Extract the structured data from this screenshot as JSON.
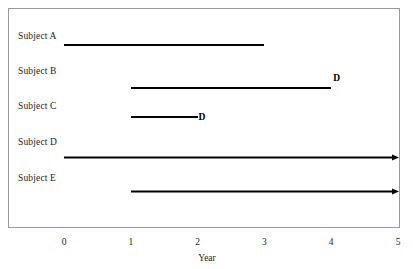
{
  "chart_data": {
    "type": "bar",
    "title": "",
    "subtitle": "",
    "xlabel": "Year",
    "ylabel": "",
    "xlim": [
      -0.5,
      5.2
    ],
    "xticks": [
      0,
      1,
      2,
      3,
      4,
      5
    ],
    "xtick_labels": [
      "0",
      "1",
      "2",
      "3",
      "4",
      "5"
    ],
    "grid": false,
    "legend": null,
    "categories": [
      "Subject A",
      "Subject B",
      "Subject C",
      "Subject D",
      "Subject E"
    ],
    "series": [
      {
        "name": "Follow-up time",
        "values": [
          3,
          3,
          1,
          5,
          4
        ]
      }
    ],
    "bars": [
      {
        "label": "Subject A",
        "start": 0,
        "end": 3,
        "end_type": "plain",
        "event_label": ""
      },
      {
        "label": "Subject B",
        "start": 1,
        "end": 4,
        "end_type": "event",
        "event_label": "D"
      },
      {
        "label": "Subject C",
        "start": 1,
        "end": 2,
        "end_type": "event",
        "event_label": "D"
      },
      {
        "label": "Subject D",
        "start": 0,
        "end": 5,
        "end_type": "arrow",
        "event_label": ""
      },
      {
        "label": "Subject E",
        "start": 1,
        "end": 5,
        "end_type": "arrow",
        "event_label": ""
      }
    ],
    "annotations": [
      "D",
      "D"
    ],
    "colors": {
      "bar": "#000000",
      "frame": "#9a9a9a",
      "text": "#1c1c1c",
      "background": "#ffffff"
    }
  },
  "axis": {
    "x_title": "Year",
    "ticks": [
      {
        "value": "0"
      },
      {
        "value": "1"
      },
      {
        "value": "2"
      },
      {
        "value": "3"
      },
      {
        "value": "4"
      },
      {
        "value": "5"
      }
    ]
  },
  "rows": [
    {
      "label": "Subject A",
      "marker": ""
    },
    {
      "label": "Subject B",
      "marker": "D"
    },
    {
      "label": "Subject C",
      "marker": "D"
    },
    {
      "label": "Subject D",
      "marker": ""
    },
    {
      "label": "Subject E",
      "marker": ""
    }
  ]
}
